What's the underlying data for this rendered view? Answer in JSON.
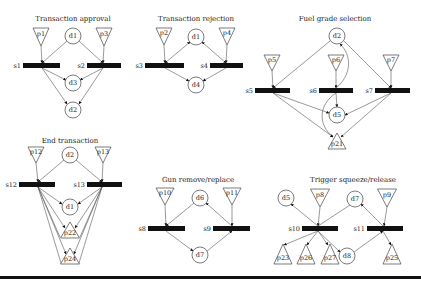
{
  "figure": {
    "bottom_rule": {
      "x": 0,
      "y": 276,
      "w": 421,
      "h": 3
    },
    "subnets": [
      {
        "id": "transaction-approval",
        "title": "Transaction approval",
        "title_pos": [
          73,
          21
        ],
        "places_down": [
          {
            "label": "p1",
            "cx": 41,
            "top": 28,
            "w": 16,
            "h": 18
          },
          {
            "label": "p3",
            "cx": 104,
            "top": 28,
            "w": 16,
            "h": 18
          }
        ],
        "places_up": [],
        "circles": [
          {
            "label": "d1",
            "cx": 73,
            "cy": 36,
            "r": 8
          },
          {
            "label": "d3",
            "cx": 73,
            "cy": 83,
            "r": 8
          },
          {
            "label": "d2",
            "cx": 73,
            "cy": 110,
            "r": 8
          }
        ],
        "bars": [
          {
            "label": "s1",
            "x": 23,
            "y": 63,
            "w": 37,
            "h": 5,
            "jx": 42
          },
          {
            "label": "s2",
            "x": 87,
            "y": 63,
            "w": 34,
            "h": 5,
            "jx": 103
          }
        ],
        "edges": [
          {
            "from": [
              41,
              46
            ],
            "to": [
              42,
              63
            ],
            "arrow": true
          },
          {
            "from": [
              104,
              46
            ],
            "to": [
              103,
              63
            ],
            "arrow": true
          },
          {
            "from": [
              67,
              41
            ],
            "to": [
              42,
              63
            ],
            "arrow": true
          },
          {
            "from": [
              79,
              41
            ],
            "to": [
              103,
              63
            ],
            "arrow": true
          },
          {
            "from": [
              42,
              68
            ],
            "to": [
              66,
              80
            ],
            "arrow": true
          },
          {
            "from": [
              103,
              68
            ],
            "to": [
              80,
              80
            ],
            "arrow": true
          },
          {
            "from": [
              42,
              68
            ],
            "to": [
              67,
              104
            ],
            "arrow": true
          },
          {
            "from": [
              103,
              68
            ],
            "to": [
              79,
              104
            ],
            "arrow": true
          }
        ]
      },
      {
        "id": "transaction-rejection",
        "title": "Transaction rejection",
        "title_pos": [
          196,
          21
        ],
        "places_down": [
          {
            "label": "p2",
            "cx": 164,
            "top": 28,
            "w": 16,
            "h": 17
          },
          {
            "label": "p4",
            "cx": 227,
            "top": 28,
            "w": 16,
            "h": 17
          }
        ],
        "places_up": [],
        "circles": [
          {
            "label": "d1",
            "cx": 196,
            "cy": 37,
            "r": 8
          },
          {
            "label": "d4",
            "cx": 196,
            "cy": 85,
            "r": 8
          }
        ],
        "bars": [
          {
            "label": "s3",
            "x": 145,
            "y": 63,
            "w": 39,
            "h": 5,
            "jx": 165
          },
          {
            "label": "s4",
            "x": 210,
            "y": 63,
            "w": 33,
            "h": 5,
            "jx": 226
          }
        ],
        "edges": [
          {
            "from": [
              164,
              45
            ],
            "to": [
              165,
              63
            ],
            "arrow": true
          },
          {
            "from": [
              227,
              45
            ],
            "to": [
              226,
              63
            ],
            "arrow": true
          },
          {
            "from": [
              190,
              42
            ],
            "to": [
              165,
              63
            ],
            "arrow": true,
            "arrow_start": true
          },
          {
            "from": [
              202,
              42
            ],
            "to": [
              226,
              63
            ],
            "arrow": true,
            "arrow_start": true
          },
          {
            "from": [
              165,
              68
            ],
            "to": [
              189,
              81
            ],
            "arrow": true
          },
          {
            "from": [
              226,
              68
            ],
            "to": [
              203,
              81
            ],
            "arrow": true
          }
        ]
      },
      {
        "id": "fuel-grade-selection",
        "title": "Fuel grade selection",
        "title_pos": [
          335,
          21
        ],
        "places_down": [
          {
            "label": "p5",
            "cx": 272,
            "top": 55,
            "w": 16,
            "h": 16
          },
          {
            "label": "p6",
            "cx": 336,
            "top": 55,
            "w": 16,
            "h": 16
          },
          {
            "label": "p7",
            "cx": 391,
            "top": 55,
            "w": 16,
            "h": 16
          }
        ],
        "places_up": [
          {
            "label": "p21",
            "cx": 337,
            "apex": 133,
            "base": 149,
            "w": 18
          }
        ],
        "circles": [
          {
            "label": "d2",
            "cx": 337,
            "cy": 36,
            "r": 8
          },
          {
            "label": "d5",
            "cx": 337,
            "cy": 115,
            "r": 8
          }
        ],
        "bars": [
          {
            "label": "s5",
            "x": 255,
            "y": 88,
            "w": 35,
            "h": 5,
            "jx": 273
          },
          {
            "label": "s6",
            "x": 319,
            "y": 88,
            "w": 34,
            "h": 5,
            "jx": 336
          },
          {
            "label": "s7",
            "x": 375,
            "y": 88,
            "w": 35,
            "h": 5,
            "jx": 391
          }
        ],
        "edges": [
          {
            "from": [
              272,
              71
            ],
            "to": [
              273,
              88
            ],
            "arrow": true
          },
          {
            "from": [
              336,
              71
            ],
            "to": [
              336,
              88
            ],
            "arrow": true
          },
          {
            "from": [
              391,
              71
            ],
            "to": [
              391,
              88
            ],
            "arrow": true
          },
          {
            "from": [
              330,
              41
            ],
            "to": [
              273,
              88
            ],
            "arrow": true
          },
          {
            "from": [
              344,
              41
            ],
            "to": [
              391,
              88
            ],
            "arrow": true
          },
          {
            "from": [
              336,
              93
            ],
            "to": [
              337,
              107
            ],
            "arrow": true
          },
          {
            "from": [
              273,
              93
            ],
            "to": [
              329,
              113
            ],
            "arrow": true
          },
          {
            "from": [
              391,
              93
            ],
            "to": [
              345,
              115
            ],
            "arrow": true
          },
          {
            "from": [
              273,
              93
            ],
            "to": [
              333,
              137
            ],
            "arrow": true
          },
          {
            "from": [
              391,
              93
            ],
            "to": [
              341,
              137
            ],
            "arrow": true
          }
        ],
        "curves": [
          {
            "d": "M336 88 C 352 75, 352 55, 340 44",
            "arrow_end": [
              340,
              44
            ],
            "arrow_from": [
              346,
              52
            ]
          },
          {
            "d": "M336 93 C 318 105, 318 125, 333 137",
            "arrow_end": [
              333,
              137
            ],
            "arrow_from": [
              326,
              130
            ]
          }
        ]
      },
      {
        "id": "end-transaction",
        "title": "End transaction",
        "title_pos": [
          70,
          143
        ],
        "places_down": [
          {
            "label": "p12",
            "cx": 36,
            "top": 147,
            "w": 16,
            "h": 16
          },
          {
            "label": "p13",
            "cx": 103,
            "top": 147,
            "w": 16,
            "h": 16
          }
        ],
        "places_up": [
          {
            "label": "p22",
            "cx": 70,
            "apex": 222,
            "base": 238,
            "w": 19
          },
          {
            "label": "p24",
            "cx": 70,
            "apex": 248,
            "base": 264,
            "w": 19
          }
        ],
        "circles": [
          {
            "label": "d2",
            "cx": 70,
            "cy": 155,
            "r": 8
          },
          {
            "label": "d1",
            "cx": 70,
            "cy": 207,
            "r": 8
          }
        ],
        "bars": [
          {
            "label": "s12",
            "x": 19,
            "y": 182,
            "w": 36,
            "h": 5,
            "jx": 38
          },
          {
            "label": "s13",
            "x": 87,
            "y": 182,
            "w": 35,
            "h": 5,
            "jx": 102
          }
        ],
        "edges": [
          {
            "from": [
              36,
              163
            ],
            "to": [
              38,
              182
            ],
            "arrow": true
          },
          {
            "from": [
              103,
              163
            ],
            "to": [
              102,
              182
            ],
            "arrow": true
          },
          {
            "from": [
              64,
              160
            ],
            "to": [
              38,
              182
            ],
            "arrow": true
          },
          {
            "from": [
              76,
              160
            ],
            "to": [
              102,
              182
            ],
            "arrow": true
          },
          {
            "from": [
              38,
              187
            ],
            "to": [
              62,
              204
            ],
            "arrow": true
          },
          {
            "from": [
              102,
              187
            ],
            "to": [
              78,
              204
            ],
            "arrow": true
          },
          {
            "from": [
              38,
              187
            ],
            "to": [
              65,
              228
            ],
            "arrow": true
          },
          {
            "from": [
              102,
              187
            ],
            "to": [
              75,
              228
            ],
            "arrow": true
          },
          {
            "from": [
              38,
              187
            ],
            "to": [
              60,
              237
            ],
            "arrow": false
          },
          {
            "from": [
              102,
              187
            ],
            "to": [
              80,
              237
            ],
            "arrow": false
          },
          {
            "from": [
              38,
              187
            ],
            "to": [
              66,
              254
            ],
            "arrow": true
          },
          {
            "from": [
              102,
              187
            ],
            "to": [
              74,
              254
            ],
            "arrow": true
          },
          {
            "from": [
              38,
              187
            ],
            "to": [
              61,
              263
            ],
            "arrow": false
          },
          {
            "from": [
              102,
              187
            ],
            "to": [
              79,
              263
            ],
            "arrow": false
          }
        ]
      },
      {
        "id": "gun-remove-replace",
        "title": "Gun remove/replace",
        "title_pos": [
          198,
          182
        ],
        "places_down": [
          {
            "label": "p10",
            "cx": 165,
            "top": 188,
            "w": 18,
            "h": 17
          },
          {
            "label": "p11",
            "cx": 232,
            "top": 188,
            "w": 18,
            "h": 17
          }
        ],
        "places_up": [],
        "circles": [
          {
            "label": "d6",
            "cx": 200,
            "cy": 198,
            "r": 8
          },
          {
            "label": "d7",
            "cx": 200,
            "cy": 255,
            "r": 8
          }
        ],
        "bars": [
          {
            "label": "s8",
            "x": 148,
            "y": 226,
            "w": 37,
            "h": 5,
            "jx": 166
          },
          {
            "label": "s9",
            "x": 213,
            "y": 226,
            "w": 37,
            "h": 5,
            "jx": 232
          }
        ],
        "edges": [
          {
            "from": [
              165,
              205
            ],
            "to": [
              166,
              226
            ],
            "arrow": true
          },
          {
            "from": [
              232,
              205
            ],
            "to": [
              232,
              226
            ],
            "arrow": true
          },
          {
            "from": [
              194,
              203
            ],
            "to": [
              166,
              226
            ],
            "arrow": true
          },
          {
            "from": [
              232,
              226
            ],
            "to": [
              206,
              203
            ],
            "arrow": true
          },
          {
            "from": [
              166,
              231
            ],
            "to": [
              193,
              251
            ],
            "arrow": true
          },
          {
            "from": [
              207,
              251
            ],
            "to": [
              232,
              231
            ],
            "arrow": true
          }
        ]
      },
      {
        "id": "trigger-squeeze-release",
        "title": "Trigger squeeze/release",
        "title_pos": [
          353,
          182
        ],
        "places_down": [
          {
            "label": "p8",
            "cx": 320,
            "top": 189,
            "w": 19,
            "h": 18
          },
          {
            "label": "p9",
            "cx": 387,
            "top": 189,
            "w": 19,
            "h": 18
          }
        ],
        "places_up": [
          {
            "label": "p23",
            "cx": 283,
            "apex": 244,
            "base": 264,
            "w": 18
          },
          {
            "label": "p26",
            "cx": 306,
            "apex": 244,
            "base": 264,
            "w": 18
          },
          {
            "label": "p27",
            "cx": 330,
            "apex": 244,
            "base": 264,
            "w": 18
          },
          {
            "label": "p25",
            "cx": 392,
            "apex": 244,
            "base": 264,
            "w": 18
          }
        ],
        "circles": [
          {
            "label": "d5",
            "cx": 286,
            "cy": 198,
            "r": 8
          },
          {
            "label": "d7",
            "cx": 355,
            "cy": 199,
            "r": 8
          },
          {
            "label": "d8",
            "cx": 347,
            "cy": 256,
            "r": 8
          }
        ],
        "bars": [
          {
            "label": "s10",
            "x": 302,
            "y": 226,
            "w": 36,
            "h": 5,
            "jx": 318
          },
          {
            "label": "s11",
            "x": 367,
            "y": 226,
            "w": 36,
            "h": 5,
            "jx": 383
          }
        ],
        "edges": [
          {
            "from": [
              320,
              207
            ],
            "to": [
              318,
              226
            ],
            "arrow": true
          },
          {
            "from": [
              387,
              207
            ],
            "to": [
              384,
              226
            ],
            "arrow": true
          },
          {
            "from": [
              318,
              226
            ],
            "to": [
              291,
              204
            ],
            "arrow": true
          },
          {
            "from": [
              350,
              205
            ],
            "to": [
              318,
              226
            ],
            "arrow": false
          },
          {
            "from": [
              383,
              226
            ],
            "to": [
              361,
              204
            ],
            "arrow": true
          },
          {
            "from": [
              318,
              231
            ],
            "to": [
              284,
              245
            ],
            "arrow": true
          },
          {
            "from": [
              318,
              231
            ],
            "to": [
              307,
              245
            ],
            "arrow": true
          },
          {
            "from": [
              318,
              231
            ],
            "to": [
              328,
              245
            ],
            "arrow": true
          },
          {
            "from": [
              318,
              231
            ],
            "to": [
              340,
              252
            ],
            "arrow": true
          },
          {
            "from": [
              354,
              252
            ],
            "to": [
              383,
              231
            ],
            "arrow": true
          },
          {
            "from": [
              383,
              231
            ],
            "to": [
              391,
              245
            ],
            "arrow": true
          }
        ]
      }
    ]
  }
}
